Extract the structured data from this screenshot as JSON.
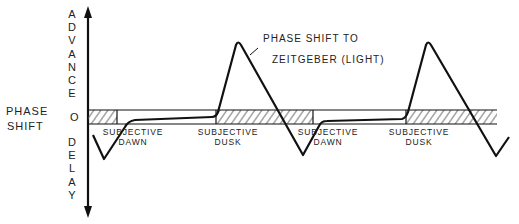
{
  "y_axis": {
    "label": "PHASE SHIFT",
    "label_line1": "PHASE",
    "label_line2": "SHIFT",
    "top": "ADVANCE",
    "bottom": "DELAY",
    "zero": "O"
  },
  "annotation": {
    "line1": "PHASE SHIFT TO",
    "line2": "ZEITGEBER (LIGHT)"
  },
  "markers": [
    {
      "line1": "SUBJECTIVE",
      "line2": "DAWN"
    },
    {
      "line1": "SUBJECTIVE",
      "line2": "DUSK"
    },
    {
      "line1": "SUBJECTIVE",
      "line2": "DAWN"
    },
    {
      "line1": "SUBJECTIVE",
      "line2": "DUSK"
    }
  ],
  "colors": {
    "line": "#111111",
    "hatch": "#555555",
    "background": "#ffffff"
  }
}
